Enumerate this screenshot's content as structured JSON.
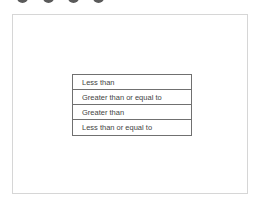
{
  "top_dots": [
    {
      "name": "dot-1",
      "left": 17
    },
    {
      "name": "dot-2",
      "left": 43
    },
    {
      "name": "dot-3",
      "left": 68
    },
    {
      "name": "dot-4",
      "left": 93
    }
  ],
  "options_list": {
    "items": [
      {
        "label": "Less than"
      },
      {
        "label": "Greater than or equal to"
      },
      {
        "label": "Greater than"
      },
      {
        "label": "Less than or equal to"
      }
    ]
  },
  "colors": {
    "dot": "#5a5a5a",
    "frame_border": "#d6d6d6",
    "list_border": "#707070",
    "text": "#444444"
  }
}
